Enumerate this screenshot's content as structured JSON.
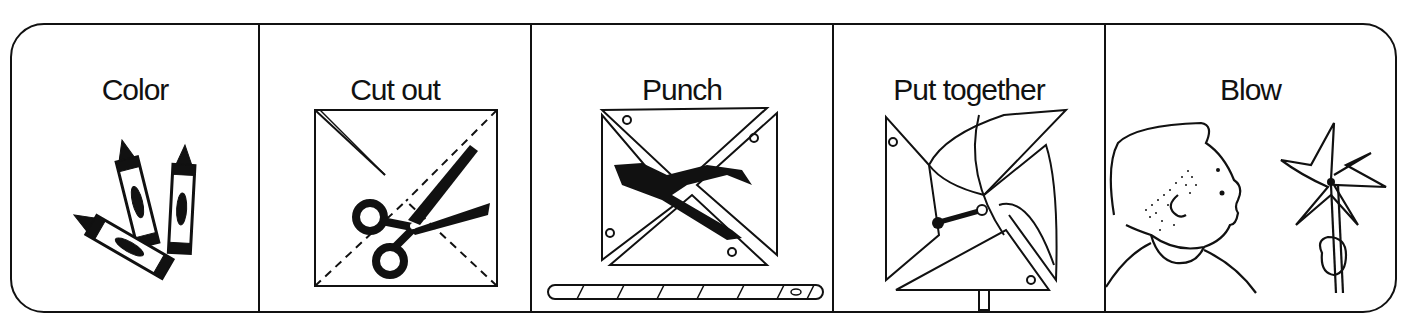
{
  "worksheet": {
    "steps": [
      {
        "label": "Color",
        "icon": "crayons-icon"
      },
      {
        "label": "Cut out",
        "icon": "scissors-icon"
      },
      {
        "label": "Punch",
        "icon": "hole-punch-icon"
      },
      {
        "label": "Put together",
        "icon": "pinwheel-assembly-icon"
      },
      {
        "label": "Blow",
        "icon": "boy-blowing-pinwheel-icon"
      }
    ],
    "colors": {
      "ink": "#111111",
      "paper": "#ffffff"
    }
  }
}
